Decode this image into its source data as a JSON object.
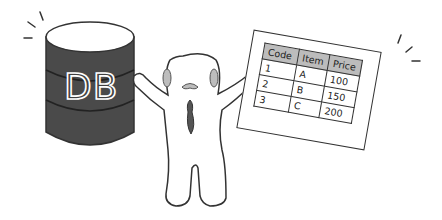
{
  "illustration": {
    "database": {
      "label": "DB",
      "body_color": "#4a4a4a",
      "top_color": "#ffffff"
    },
    "character": {
      "cheek_color": "#bdbdbd",
      "mouth_color": "#555555"
    },
    "table_card": {
      "columns": [
        "Code",
        "Item",
        "Price"
      ],
      "rows": [
        [
          "1",
          "A",
          "100"
        ],
        [
          "2",
          "B",
          "150"
        ],
        [
          "3",
          "C",
          "200"
        ]
      ],
      "header_color": "#bcbcbc"
    }
  }
}
